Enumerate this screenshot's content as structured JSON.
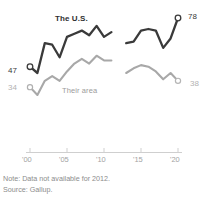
{
  "chart_data": {
    "type": "line",
    "title": "",
    "xlabel": "",
    "ylabel": "",
    "xlim": [
      2000,
      2020
    ],
    "ylim": [
      20,
      85
    ],
    "grid": false,
    "legend": "inline-labels",
    "xtick_labels": [
      "'00",
      "'05",
      "'10",
      "'15",
      "'20"
    ],
    "xtick_values": [
      2000,
      2005,
      2010,
      2015,
      2020
    ],
    "missing_year": 2012,
    "series": [
      {
        "name": "The U.S.",
        "color": "#3a3a3a",
        "start_label": "47",
        "end_label": "78",
        "start_value": 47,
        "end_value": 78,
        "x": [
          2000,
          2001,
          2002,
          2003,
          2004,
          2005,
          2006,
          2007,
          2008,
          2009,
          2010,
          2011,
          2013,
          2014,
          2015,
          2016,
          2017,
          2018,
          2019,
          2020
        ],
        "values": [
          47,
          43,
          62,
          61,
          53,
          66,
          68,
          70,
          67,
          73,
          66,
          69,
          62,
          63,
          70,
          71,
          70,
          59,
          65,
          78
        ]
      },
      {
        "name": "Their area",
        "color": "#a8a8a8",
        "start_label": "34",
        "end_label": "38",
        "start_value": 34,
        "end_value": 38,
        "x": [
          2000,
          2001,
          2002,
          2003,
          2004,
          2005,
          2006,
          2007,
          2008,
          2009,
          2010,
          2011,
          2013,
          2014,
          2015,
          2016,
          2017,
          2018,
          2019,
          2020
        ],
        "values": [
          34,
          29,
          38,
          41,
          38,
          44,
          49,
          52,
          49,
          54,
          51,
          51,
          43,
          46,
          48,
          47,
          44,
          39,
          43,
          38
        ]
      }
    ]
  },
  "annotations": {
    "us_label": "The U.S.",
    "their_label": "Their area",
    "us_start": "47",
    "us_end": "78",
    "their_start": "34",
    "their_end": "38"
  },
  "axis": {
    "ticks": [
      "'00",
      "'05",
      "'10",
      "'15",
      "'20"
    ]
  },
  "footnotes": {
    "note": "Note: Data not available for 2012.",
    "source": "Source: Gallup."
  }
}
